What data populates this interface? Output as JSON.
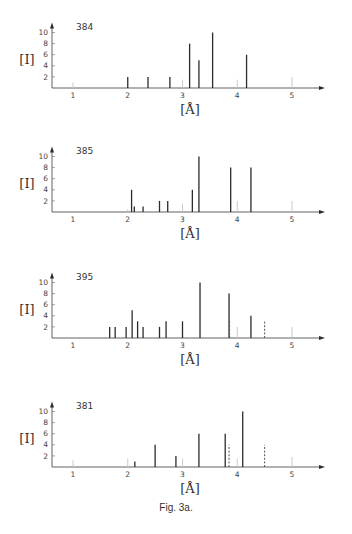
{
  "figure": {
    "caption": "Fig. 3a."
  },
  "chart_data": [
    {
      "type": "bar",
      "title": "384",
      "xlabel": "[Å]",
      "ylabel": "[I]",
      "xlim": [
        0.7,
        5.5
      ],
      "ylim": [
        0,
        10
      ],
      "xticks": [
        "1",
        "2",
        "3",
        "4",
        "5"
      ],
      "yticks": [
        "2",
        "4",
        "6",
        "8",
        "10"
      ],
      "grid": false,
      "series": [
        {
          "name": "observed",
          "style": "solid",
          "x": [
            2.0,
            2.37,
            2.77,
            3.13,
            3.3,
            3.55,
            4.17
          ],
          "values": [
            2,
            2,
            2,
            8,
            5,
            10,
            6
          ]
        },
        {
          "name": "reference",
          "style": "faint",
          "x": [
            1.0,
            3.0,
            4.0,
            5.0
          ],
          "values": [
            1,
            1.5,
            1.5,
            2
          ]
        }
      ]
    },
    {
      "type": "bar",
      "title": "385",
      "xlabel": "[Å]",
      "ylabel": "[I]",
      "xlim": [
        0.7,
        5.5
      ],
      "ylim": [
        0,
        10
      ],
      "xticks": [
        "1",
        "2",
        "3",
        "4",
        "5"
      ],
      "yticks": [
        "2",
        "4",
        "6",
        "8",
        "10"
      ],
      "grid": false,
      "series": [
        {
          "name": "observed",
          "style": "solid",
          "x": [
            2.07,
            2.12,
            2.28,
            2.58,
            2.73,
            3.18,
            3.3,
            3.88,
            4.25
          ],
          "values": [
            4,
            1,
            1,
            2,
            2,
            4,
            10,
            8,
            8
          ]
        },
        {
          "name": "reference",
          "style": "faint",
          "x": [
            2.0,
            3.0,
            4.0,
            5.0
          ],
          "values": [
            0.5,
            1.5,
            2,
            2
          ]
        }
      ]
    },
    {
      "type": "bar",
      "title": "395",
      "xlabel": "[Å]",
      "ylabel": "[I]",
      "xlim": [
        0.7,
        5.5
      ],
      "ylim": [
        0,
        10
      ],
      "xticks": [
        "1",
        "2",
        "3",
        "4",
        "5"
      ],
      "yticks": [
        "2",
        "4",
        "6",
        "8",
        "10"
      ],
      "grid": false,
      "series": [
        {
          "name": "observed",
          "style": "solid",
          "x": [
            1.67,
            1.77,
            1.97,
            2.08,
            2.18,
            2.28,
            2.58,
            2.7,
            3.0,
            3.32,
            3.85,
            4.25
          ],
          "values": [
            2,
            2,
            2,
            5,
            3,
            2,
            2,
            3,
            3,
            10,
            8,
            4
          ]
        },
        {
          "name": "dashed",
          "style": "dashed",
          "x": [
            3.86,
            4.5
          ],
          "values": [
            3,
            3
          ]
        },
        {
          "name": "reference",
          "style": "faint",
          "x": [
            4.0,
            5.0
          ],
          "values": [
            2,
            2
          ]
        }
      ]
    },
    {
      "type": "bar",
      "title": "381",
      "xlabel": "[Å]",
      "ylabel": "[I]",
      "xlim": [
        0.7,
        5.5
      ],
      "ylim": [
        0,
        10
      ],
      "xticks": [
        "1",
        "2",
        "3",
        "4",
        "5"
      ],
      "yticks": [
        "2",
        "4",
        "6",
        "8",
        "10"
      ],
      "grid": false,
      "series": [
        {
          "name": "observed",
          "style": "solid",
          "x": [
            2.13,
            2.5,
            2.88,
            3.3,
            3.78,
            4.1
          ],
          "values": [
            1,
            4,
            2,
            6,
            6,
            10
          ]
        },
        {
          "name": "dashed",
          "style": "dashed",
          "x": [
            3.85,
            4.5
          ],
          "values": [
            4,
            4
          ]
        },
        {
          "name": "reference",
          "style": "faint",
          "x": [
            1.0,
            2.0,
            3.0,
            4.0,
            5.0
          ],
          "values": [
            1.2,
            1.5,
            1.5,
            1.5,
            1.8
          ]
        }
      ]
    }
  ]
}
